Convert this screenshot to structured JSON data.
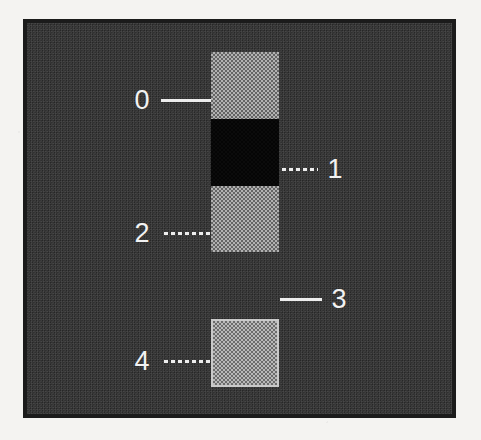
{
  "figure": {
    "background_color": "#f4f3f1",
    "panel_background_color": "#333333",
    "panel_border_color": "#1b1b1b",
    "label_color": "#f2f2f2",
    "leader_color": "#ededed"
  },
  "bands": [
    {
      "id": "band-0",
      "label": "0",
      "fill": "halftone-gray",
      "fill_color": "#8f8f8f",
      "outlined": false,
      "x": 184,
      "y": 29,
      "width": 68,
      "height": 67
    },
    {
      "id": "band-1",
      "label": "1",
      "fill": "solid-black",
      "fill_color": "#050505",
      "outlined": false,
      "x": 184,
      "y": 96,
      "width": 68,
      "height": 67
    },
    {
      "id": "band-2",
      "label": "2",
      "fill": "halftone-gray",
      "fill_color": "#8f8f8f",
      "outlined": false,
      "x": 184,
      "y": 163,
      "width": 68,
      "height": 66
    },
    {
      "id": "band-3",
      "label": "3",
      "fill": "background-gap",
      "fill_color": "#333333",
      "outlined": false,
      "x": 184,
      "y": 229,
      "width": 68,
      "height": 67
    },
    {
      "id": "band-4",
      "label": "4",
      "fill": "halftone-gray-outlined",
      "fill_color": "#9b9b9b",
      "outlined": true,
      "x": 184,
      "y": 296,
      "width": 68,
      "height": 68
    }
  ],
  "callouts": [
    {
      "id": "callout-0",
      "label": "0",
      "side": "left",
      "line_style": "solid",
      "label_x": 103,
      "label_y": 64,
      "line_x": 134,
      "line_y": 76,
      "line_width": 50
    },
    {
      "id": "callout-1",
      "label": "1",
      "side": "right",
      "line_style": "dashed",
      "label_x": 296,
      "label_y": 133,
      "line_x": 255,
      "line_y": 145,
      "line_width": 36
    },
    {
      "id": "callout-2",
      "label": "2",
      "side": "left",
      "line_style": "dashed",
      "label_x": 103,
      "label_y": 197,
      "line_x": 137,
      "line_y": 209,
      "line_width": 47
    },
    {
      "id": "callout-3",
      "label": "3",
      "side": "right",
      "line_style": "solid",
      "label_x": 300,
      "label_y": 263,
      "line_x": 253,
      "line_y": 275,
      "line_width": 42
    },
    {
      "id": "callout-4",
      "label": "4",
      "side": "left",
      "line_style": "dashed",
      "label_x": 103,
      "label_y": 325,
      "line_x": 137,
      "line_y": 337,
      "line_width": 47
    }
  ]
}
